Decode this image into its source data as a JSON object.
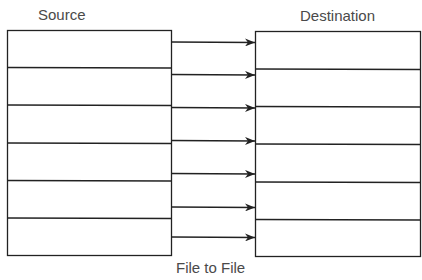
{
  "diagram": {
    "caption": "File to File",
    "source": {
      "label": "Source",
      "rows": 6
    },
    "destination": {
      "label": "Destination",
      "rows": 6
    },
    "arrows": 7,
    "colors": {
      "stroke": "#222222",
      "text": "#4a4a4a",
      "background": "#ffffff"
    }
  }
}
